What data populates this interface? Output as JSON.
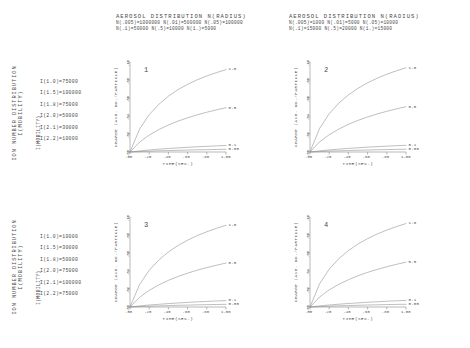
{
  "figure": {
    "axis_label_y_outer": "ION NUMBER DISTRIBUTION I(MOBILITY)",
    "axis_label_y_outer_line1": "ION NUMBER DISTRIBUTION",
    "axis_label_y_outer_line2": "I(MOBILITY)",
    "mobility_header": "I(MOBILITY)"
  },
  "panels": [
    {
      "number": "1",
      "header_title": "AEROSOL DISTRIBUTION  N(RADIUS)",
      "header_line1": "N(.005)=1000000  N(.01)=500000  N(.05)=100000",
      "header_line2": "N(.1)=50000   N(.5)=10000   N(1.)=5000",
      "legend": [
        "I(1.0)=75000",
        "I(1.5)=100000",
        "I(1.8)=75000",
        "I(2.0)=50000",
        "I(2.1)=30000",
        "I(2.2)=10000"
      ]
    },
    {
      "number": "2",
      "header_title": "AEROSOL DISTRIBUTION  N(RADIUS)",
      "header_line1": "N(.005)=1000  N(.01)=5000  N(.05)=10000",
      "header_line2": "N(.1)=15000   N(.5)=20000   N(1.)=15000",
      "legend": []
    },
    {
      "number": "3",
      "header_title": "",
      "header_line1": "",
      "header_line2": "",
      "legend": [
        "I(1.0)=10000",
        "I(1.5)=30000",
        "I(1.8)=50000",
        "I(2.0)=75000",
        "I(2.1)=100000",
        "I(2.2)=75000"
      ]
    },
    {
      "number": "4",
      "header_title": "",
      "header_line1": "",
      "header_line2": "",
      "legend": []
    }
  ],
  "chart_data": {
    "type": "line",
    "title": "AEROSOL DISTRIBUTION  N(RADIUS)",
    "xlabel": "TIME(SEC.)",
    "ylabel": "CHARGE (AVG. NO./PARTICLE)",
    "xlim": [
      0,
      1.0
    ],
    "ylim": [
      0,
      0.1
    ],
    "xticks": [
      ".00",
      ".20",
      ".40",
      ".60",
      ".80",
      "1.00"
    ],
    "xtick_values": [
      0.0,
      0.2,
      0.4,
      0.6,
      0.8,
      1.0
    ],
    "yticks": [
      ".00",
      ".02",
      ".04",
      ".06",
      ".08",
      ".10"
    ],
    "ytick_values": [
      0.0,
      0.02,
      0.04,
      0.06,
      0.08,
      0.1
    ],
    "grid": false,
    "legend_position": "right-of-curve-end",
    "series_labels": [
      "1.0",
      "0.5",
      "0.1",
      "0.05"
    ],
    "panels": [
      {
        "number": "1",
        "series": [
          {
            "name": "1.0",
            "x": [
              0,
              0.1,
              0.2,
              0.3,
              0.4,
              0.5,
              0.6,
              0.7,
              0.8,
              0.9,
              1.0
            ],
            "values": [
              0,
              0.0255,
              0.0415,
              0.053,
              0.062,
              0.0693,
              0.0752,
              0.0802,
              0.0845,
              0.0882,
              0.0915
            ]
          },
          {
            "name": "0.5",
            "x": [
              0,
              0.1,
              0.2,
              0.3,
              0.4,
              0.5,
              0.6,
              0.7,
              0.8,
              0.9,
              1.0
            ],
            "values": [
              0,
              0.011,
              0.0188,
              0.0249,
              0.03,
              0.0343,
              0.038,
              0.0413,
              0.0442,
              0.0468,
              0.0492
            ]
          },
          {
            "name": "0.1",
            "x": [
              0,
              0.1,
              0.2,
              0.3,
              0.4,
              0.5,
              0.6,
              0.7,
              0.8,
              0.9,
              1.0
            ],
            "values": [
              0,
              0.0012,
              0.0022,
              0.0031,
              0.0039,
              0.0046,
              0.0052,
              0.0058,
              0.0063,
              0.0068,
              0.0072
            ]
          },
          {
            "name": "0.05",
            "x": [
              0,
              0.1,
              0.2,
              0.3,
              0.4,
              0.5,
              0.6,
              0.7,
              0.8,
              0.9,
              1.0
            ],
            "values": [
              0,
              0.0005,
              0.0009,
              0.0013,
              0.0016,
              0.0019,
              0.0022,
              0.0024,
              0.0026,
              0.0028,
              0.003
            ]
          }
        ]
      },
      {
        "number": "2",
        "series": [
          {
            "name": "1.0",
            "x": [
              0,
              0.1,
              0.2,
              0.3,
              0.4,
              0.5,
              0.6,
              0.7,
              0.8,
              0.9,
              1.0
            ],
            "values": [
              0,
              0.0262,
              0.0425,
              0.0543,
              0.0634,
              0.0708,
              0.0769,
              0.082,
              0.0864,
              0.0902,
              0.0936
            ]
          },
          {
            "name": "0.5",
            "x": [
              0,
              0.1,
              0.2,
              0.3,
              0.4,
              0.5,
              0.6,
              0.7,
              0.8,
              0.9,
              1.0
            ],
            "values": [
              0,
              0.0113,
              0.0192,
              0.0255,
              0.0307,
              0.0351,
              0.0389,
              0.0423,
              0.0452,
              0.0479,
              0.0503
            ]
          },
          {
            "name": "0.1",
            "x": [
              0,
              0.1,
              0.2,
              0.3,
              0.4,
              0.5,
              0.6,
              0.7,
              0.8,
              0.9,
              1.0
            ],
            "values": [
              0,
              0.0013,
              0.0023,
              0.0032,
              0.004,
              0.0047,
              0.0054,
              0.0059,
              0.0065,
              0.007,
              0.0074
            ]
          },
          {
            "name": "0.05",
            "x": [
              0,
              0.1,
              0.2,
              0.3,
              0.4,
              0.5,
              0.6,
              0.7,
              0.8,
              0.9,
              1.0
            ],
            "values": [
              0,
              0.0005,
              0.001,
              0.0013,
              0.0017,
              0.002,
              0.0022,
              0.0025,
              0.0027,
              0.0029,
              0.0031
            ]
          }
        ]
      },
      {
        "number": "3",
        "series": [
          {
            "name": "1.0",
            "x": [
              0,
              0.1,
              0.2,
              0.3,
              0.4,
              0.5,
              0.6,
              0.7,
              0.8,
              0.9,
              1.0
            ],
            "values": [
              0,
              0.025,
              0.0408,
              0.0522,
              0.0611,
              0.0683,
              0.0743,
              0.0793,
              0.0836,
              0.0874,
              0.0908
            ]
          },
          {
            "name": "0.5",
            "x": [
              0,
              0.1,
              0.2,
              0.3,
              0.4,
              0.5,
              0.6,
              0.7,
              0.8,
              0.9,
              1.0
            ],
            "values": [
              0,
              0.0108,
              0.0185,
              0.0246,
              0.0296,
              0.0339,
              0.0376,
              0.0409,
              0.0438,
              0.0464,
              0.0488
            ]
          },
          {
            "name": "0.1",
            "x": [
              0,
              0.1,
              0.2,
              0.3,
              0.4,
              0.5,
              0.6,
              0.7,
              0.8,
              0.9,
              1.0
            ],
            "values": [
              0,
              0.0012,
              0.0022,
              0.003,
              0.0038,
              0.0045,
              0.0051,
              0.0057,
              0.0062,
              0.0067,
              0.0071
            ]
          },
          {
            "name": "0.05",
            "x": [
              0,
              0.1,
              0.2,
              0.3,
              0.4,
              0.5,
              0.6,
              0.7,
              0.8,
              0.9,
              1.0
            ],
            "values": [
              0,
              0.0005,
              0.0009,
              0.0012,
              0.0016,
              0.0019,
              0.0021,
              0.0024,
              0.0026,
              0.0028,
              0.0029
            ]
          }
        ]
      },
      {
        "number": "4",
        "series": [
          {
            "name": "1.0",
            "x": [
              0,
              0.1,
              0.2,
              0.3,
              0.4,
              0.5,
              0.6,
              0.7,
              0.8,
              0.9,
              1.0
            ],
            "values": [
              0,
              0.0258,
              0.042,
              0.0537,
              0.0627,
              0.07,
              0.076,
              0.0811,
              0.0855,
              0.0893,
              0.0927
            ]
          },
          {
            "name": "0.5",
            "x": [
              0,
              0.1,
              0.2,
              0.3,
              0.4,
              0.5,
              0.6,
              0.7,
              0.8,
              0.9,
              1.0
            ],
            "values": [
              0,
              0.0111,
              0.019,
              0.0252,
              0.0303,
              0.0347,
              0.0385,
              0.0418,
              0.0447,
              0.0474,
              0.0498
            ]
          },
          {
            "name": "0.1",
            "x": [
              0,
              0.1,
              0.2,
              0.3,
              0.4,
              0.5,
              0.6,
              0.7,
              0.8,
              0.9,
              1.0
            ],
            "values": [
              0,
              0.0012,
              0.0022,
              0.0031,
              0.0039,
              0.0046,
              0.0053,
              0.0058,
              0.0064,
              0.0069,
              0.0073
            ]
          },
          {
            "name": "0.05",
            "x": [
              0,
              0.1,
              0.2,
              0.3,
              0.4,
              0.5,
              0.6,
              0.7,
              0.8,
              0.9,
              1.0
            ],
            "values": [
              0,
              0.0005,
              0.0009,
              0.0013,
              0.0016,
              0.0019,
              0.0022,
              0.0024,
              0.0027,
              0.0029,
              0.003
            ]
          }
        ]
      }
    ]
  }
}
